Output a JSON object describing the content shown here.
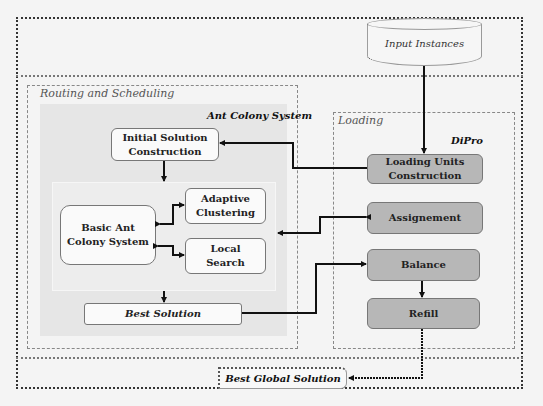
{
  "diagram": {
    "input": {
      "label": "Input Instances",
      "shape": "cylinder"
    },
    "routing_group": {
      "label": "Routing and Scheduling",
      "panel_title": "Ant Colony System",
      "nodes": {
        "initial_solution": "Initial Solution Construction",
        "basic_acs": "Basic Ant Colony System",
        "adaptive_clustering": "Adaptive Clustering",
        "local_search": "Local Search",
        "best_solution": "Best Solution"
      }
    },
    "loading_group": {
      "label": "Loading",
      "panel_title": "DiPro",
      "nodes": {
        "loading_units": "Loading Units Construction",
        "assignement": "Assignement",
        "balance": "Balance",
        "refill": "Refill"
      }
    },
    "output": {
      "label": "Best Global Solution"
    },
    "edges": [
      {
        "from": "Input Instances",
        "to": "Loading Units Construction"
      },
      {
        "from": "Loading Units Construction",
        "to": "Initial Solution Construction"
      },
      {
        "from": "Initial Solution Construction",
        "to": "Basic Ant Colony System"
      },
      {
        "from": "Basic Ant Colony System",
        "to": "Adaptive Clustering",
        "bidirectional": true
      },
      {
        "from": "Basic Ant Colony System",
        "to": "Local Search",
        "bidirectional": true
      },
      {
        "from": "Assignement",
        "to": "Ant Colony System",
        "bidirectional": true
      },
      {
        "from": "Basic Ant Colony System",
        "to": "Best Solution"
      },
      {
        "from": "Best Solution",
        "to": "Balance"
      },
      {
        "from": "Balance",
        "to": "Refill"
      },
      {
        "from": "Refill",
        "to": "Best Global Solution"
      }
    ],
    "colors": {
      "background": "#f4f4f4",
      "acs_panel": "#e6e6e6",
      "dipro_node": "#b7b7b7",
      "white_node": "#fafafa",
      "arrow": "#111111"
    }
  }
}
